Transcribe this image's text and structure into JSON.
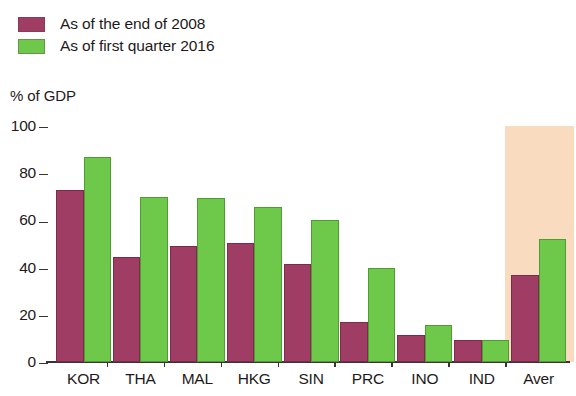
{
  "legend": {
    "items": [
      {
        "label": "As of the end of 2008",
        "color": "#9f3d64",
        "swatch_name": "legend-swatch-2008"
      },
      {
        "label": "As of first quarter 2016",
        "color": "#6ec84a",
        "swatch_name": "legend-swatch-2016"
      }
    ]
  },
  "axis_caption": "% of GDP",
  "colors": {
    "series_2008": "#9f3d64",
    "series_2016": "#6ec84a",
    "highlight_band": "#f9dcbf",
    "axis": "#3a3336",
    "text": "#1e1a1b",
    "background": "#ffffff"
  },
  "highlight": {
    "category": "Aver",
    "color": "#f9dcbf",
    "top_value": 100
  },
  "chart_data": {
    "type": "bar",
    "title": "",
    "subtitle": "",
    "xlabel": "",
    "ylabel": "% of GDP",
    "ylim": [
      0,
      100
    ],
    "yticks": [
      0,
      20,
      40,
      60,
      80,
      100
    ],
    "ytick_labels": [
      "0",
      "20",
      "40",
      "60",
      "80",
      "100"
    ],
    "grid": false,
    "legend_position": "top-left",
    "categories": [
      "KOR",
      "THA",
      "MAL",
      "HKG",
      "SIN",
      "PRC",
      "INO",
      "IND",
      "Aver"
    ],
    "series": [
      {
        "name": "As of the end of 2008",
        "color": "#9f3d64",
        "values": [
          73,
          44.5,
          49,
          50.5,
          41.5,
          17,
          11.5,
          9.5,
          37
        ]
      },
      {
        "name": "As of first quarter 2016",
        "color": "#6ec84a",
        "values": [
          87,
          70,
          69.5,
          65.5,
          60,
          40,
          15.5,
          9.5,
          52
        ]
      }
    ]
  }
}
